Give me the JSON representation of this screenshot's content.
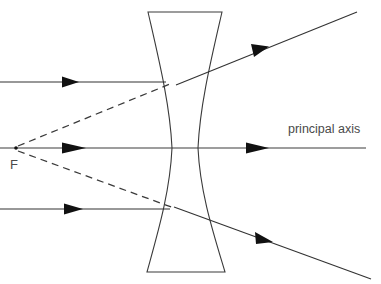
{
  "diagram": {
    "type": "ray-optics",
    "canvas": {
      "width": 381,
      "height": 284,
      "background": "#ffffff"
    },
    "colors": {
      "stroke": "#333333",
      "lens_stroke": "#3a3a3a",
      "axis_stroke": "#3d3d3d",
      "label_text": "#4a4a4a",
      "arrow_fill": "#111111",
      "virtual_ray": "#3a3a3a"
    },
    "labels": {
      "focal_point": "F",
      "principal_axis": "principal axis"
    },
    "lens": {
      "name": "diverging-concave-lens",
      "top_edge": {
        "x1": 148,
        "x2": 222,
        "y": 12
      },
      "bottom_edge": {
        "x1": 147,
        "x2": 225,
        "y": 272
      },
      "waist_left_x": 172,
      "waist_right_x": 198,
      "center_y": 148
    },
    "focal_point": {
      "x": 16,
      "y": 148
    },
    "principal_axis": {
      "y": 148,
      "x_start": 0,
      "x_end": 366
    },
    "rays": [
      {
        "name": "upper-parallel-incident-ray",
        "kind": "incident",
        "y": 82,
        "x_start": 0,
        "x_end": 166,
        "arrow_x": 72
      },
      {
        "name": "axis-incident-ray",
        "kind": "incident-on-axis",
        "y": 148,
        "x_start": 0,
        "x_end": 366,
        "arrow_x": 78
      },
      {
        "name": "lower-parallel-incident-ray",
        "kind": "incident",
        "y": 209,
        "x_start": 0,
        "x_end": 170,
        "arrow_x": 76
      },
      {
        "name": "upper-refracted-ray",
        "kind": "refracted",
        "from": {
          "x": 178,
          "y": 84
        },
        "to": {
          "x": 357,
          "y": 12
        },
        "arrow": {
          "x": 260,
          "y": 51
        }
      },
      {
        "name": "lower-refracted-ray",
        "kind": "refracted",
        "from": {
          "x": 176,
          "y": 207
        },
        "to": {
          "x": 371,
          "y": 279
        },
        "arrow": {
          "x": 264,
          "y": 240
        }
      },
      {
        "name": "axis-refracted-ray-arrow",
        "kind": "refracted-on-axis",
        "y": 148,
        "arrow_x": 262
      }
    ],
    "virtual_rays": [
      {
        "name": "upper-virtual-ray-to-focus",
        "from": {
          "x": 18,
          "y": 146
        },
        "to": {
          "x": 170,
          "y": 84
        }
      },
      {
        "name": "lower-virtual-ray-to-focus",
        "from": {
          "x": 18,
          "y": 151
        },
        "to": {
          "x": 174,
          "y": 208
        }
      }
    ]
  }
}
